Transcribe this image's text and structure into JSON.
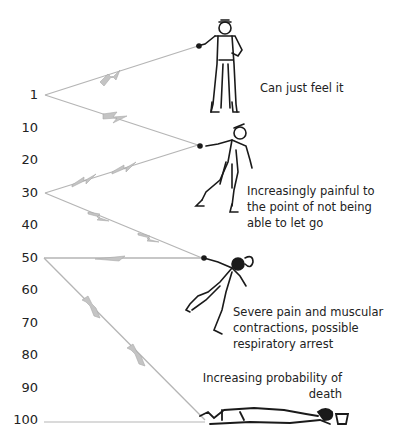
{
  "scale": {
    "unit_hint": "current (mA)",
    "labels": [
      {
        "value": "1",
        "y": 95
      },
      {
        "value": "10",
        "y": 128
      },
      {
        "value": "20",
        "y": 160
      },
      {
        "value": "30",
        "y": 193
      },
      {
        "value": "40",
        "y": 225
      },
      {
        "value": "50",
        "y": 258
      },
      {
        "value": "60",
        "y": 290
      },
      {
        "value": "70",
        "y": 323
      },
      {
        "value": "80",
        "y": 355
      },
      {
        "value": "90",
        "y": 388
      },
      {
        "value": "100",
        "y": 420
      }
    ]
  },
  "stages": [
    {
      "level": "1",
      "caption": "Can just feel it",
      "figure": "standing-worker-figure"
    },
    {
      "level": "30",
      "caption": "Increasingly painful to the point of not being able to let go",
      "figure": "staggering-worker-figure"
    },
    {
      "level": "50",
      "caption": "Severe pain and muscular contractions, possible respiratory arrest",
      "figure": "falling-worker-figure"
    },
    {
      "level": "100",
      "caption": "Increasing probability of death",
      "figure": "lying-worker-figure"
    }
  ],
  "captions": {
    "stage1": "Can just feel it",
    "stage2_line1": "Increasingly painful to",
    "stage2_line2": "the point of not being",
    "stage2_line3": "able to let go",
    "stage3_line1": "Severe pain and muscular",
    "stage3_line2": "contractions, possible",
    "stage3_line3": "respiratory arrest",
    "stage4_line1": "Increasing probability of",
    "stage4_line2": "death"
  },
  "colors": {
    "line": "#b8b8b8",
    "bolt": "#c8c8c8",
    "ink": "#1a1a1a"
  }
}
